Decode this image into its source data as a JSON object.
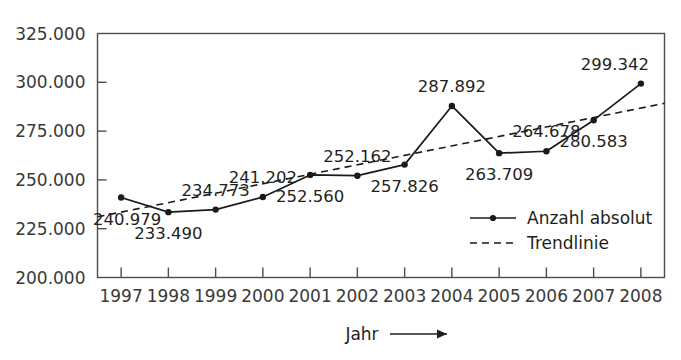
{
  "chart_data": {
    "type": "line",
    "title": "",
    "subtitle": "",
    "xlabel": "Jahr",
    "ylabel": "",
    "x": [
      1997,
      1998,
      1999,
      2000,
      2001,
      2002,
      2003,
      2004,
      2005,
      2006,
      2007,
      2008
    ],
    "categories": [
      "1997",
      "1998",
      "1999",
      "2000",
      "2001",
      "2002",
      "2003",
      "2004",
      "2005",
      "2006",
      "2007",
      "2008"
    ],
    "series": [
      {
        "name": "Anzahl absolut",
        "style": "solid-with-markers",
        "values": [
          240979,
          233490,
          234773,
          241202,
          252560,
          252162,
          257826,
          287892,
          263709,
          264678,
          280583,
          299342
        ],
        "value_labels": [
          "240.979",
          "233.490",
          "234.773",
          "241.202",
          "252.560",
          "252.162",
          "257.826",
          "287.892",
          "263.709",
          "264.678",
          "280.583",
          "299.342"
        ],
        "label_placement": [
          "below",
          "below",
          "above",
          "above",
          "below",
          "above",
          "below",
          "above",
          "below",
          "above",
          "below",
          "above"
        ]
      },
      {
        "name": "Trendlinie",
        "style": "dashed",
        "values": [
          233500,
          238300,
          243200,
          248000,
          252900,
          257700,
          262600,
          267400,
          272300,
          277100,
          282000,
          286800
        ],
        "value_labels": [],
        "label_placement": []
      }
    ],
    "ylim": [
      200000,
      325000
    ],
    "yticks": [
      200000,
      225000,
      250000,
      275000,
      300000,
      325000
    ],
    "ytick_labels": [
      "200.000",
      "225.000",
      "250.000",
      "275.000",
      "300.000",
      "325.000"
    ],
    "grid": false,
    "legend_position": "inside-bottom-right",
    "legend": [
      {
        "label": "Anzahl absolut",
        "marker": "solid-line-dot"
      },
      {
        "label": "Trendlinie",
        "marker": "dashed-line"
      }
    ],
    "colors": {
      "series_line": "#1a1a1a",
      "trend_line": "#1a1a1a",
      "axis": "#4d4d4d",
      "text": "#231f20",
      "background": "#ffffff"
    },
    "annotations": {
      "x_axis_arrow": "→"
    }
  }
}
